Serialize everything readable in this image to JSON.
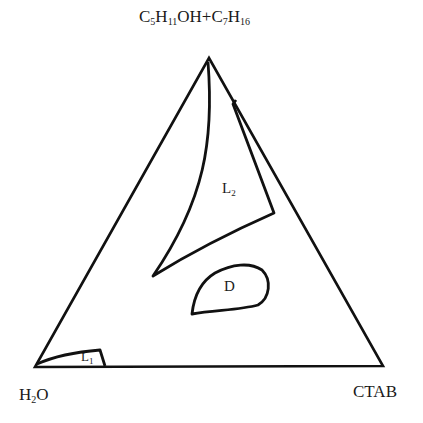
{
  "diagram": {
    "type": "ternary-phase-diagram",
    "vertices": {
      "top": {
        "main": "C",
        "s1": "5",
        "h": "H",
        "s2": "11",
        "rest": "OH+C",
        "s3": "7",
        "h2": "H",
        "s4": "16"
      },
      "bottom_left": {
        "main": "H",
        "sub": "2",
        "rest": "O"
      },
      "bottom_right": {
        "label": "CTAB"
      }
    },
    "regions": [
      {
        "name": "L",
        "sub": "2",
        "description": "large curved-triangular region near oil apex"
      },
      {
        "name": "D",
        "sub": "",
        "description": "closed blob region in center"
      },
      {
        "name": "L",
        "sub": "1",
        "description": "small region at water corner"
      }
    ],
    "colors": {
      "line": "#111111",
      "background": "#ffffff"
    }
  }
}
